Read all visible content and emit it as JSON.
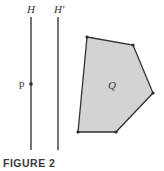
{
  "figure": {
    "caption": "FIGURE 2",
    "colors": {
      "line": "#2a2a2a",
      "polygon_fill": "#d3d3d3",
      "polygon_stroke": "#333333",
      "text": "#333333"
    },
    "lines": [
      {
        "label": "H",
        "x": 31,
        "y1": 17,
        "y2": 150
      },
      {
        "label": "H'",
        "x": 58,
        "y1": 17,
        "y2": 150
      }
    ],
    "point": {
      "label": "p",
      "x": 31,
      "y": 84
    },
    "polygon": {
      "label": "Q",
      "vertices": [
        [
          87,
          37
        ],
        [
          133,
          45
        ],
        [
          153,
          93
        ],
        [
          116,
          132
        ],
        [
          78,
          132
        ]
      ]
    }
  }
}
